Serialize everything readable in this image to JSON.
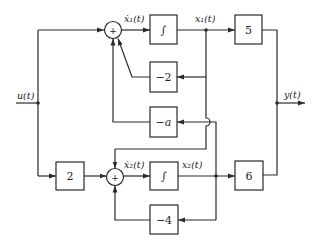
{
  "diagram": {
    "type": "block-diagram",
    "signals": {
      "input": "u(t)",
      "output": "y(t)",
      "x1_dot": "ẋ₁(t)",
      "x1": "x₁(t)",
      "x2_dot": "ẋ₂(t)",
      "x2": "x₂(t)"
    },
    "blocks": {
      "int1": "∫",
      "int2": "∫",
      "gain_5": "5",
      "gain_6": "6",
      "gain_neg2": "−2",
      "gain_neg_a": "−a",
      "gain_2": "2",
      "gain_neg4": "−4"
    },
    "summers": {
      "sum1": "+",
      "sum2": "+"
    }
  }
}
